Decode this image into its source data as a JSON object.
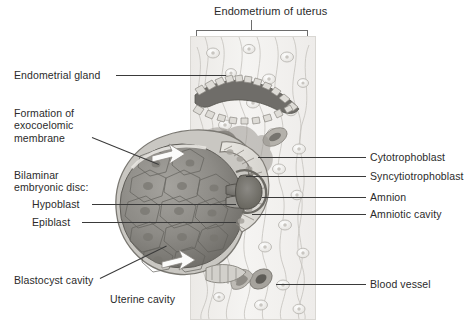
{
  "figure": {
    "title": "Endometrium of uterus",
    "background_color": "#ffffff",
    "label_color": "#2b2b2b",
    "leader_color": "#3a3a3a"
  },
  "labels_left": [
    {
      "id": "endometrial-gland",
      "text": "Endometrial gland"
    },
    {
      "id": "exocoelomic-membrane",
      "line1": "Formation of",
      "line2": "exocoelomic",
      "line3": "membrane"
    },
    {
      "id": "bilaminar-disc",
      "line1": "Bilaminar",
      "line2": "embryonic disc:"
    },
    {
      "id": "hypoblast",
      "text": "Hypoblast"
    },
    {
      "id": "epiblast",
      "text": "Epiblast"
    },
    {
      "id": "blastocyst-cavity",
      "text": "Blastocyst cavity"
    },
    {
      "id": "uterine-cavity",
      "text": "Uterine cavity"
    }
  ],
  "labels_right": [
    {
      "id": "cytotrophoblast",
      "text": "Cytotrophoblast"
    },
    {
      "id": "syncytiotrophoblast",
      "text": "Syncytiotrophoblast"
    },
    {
      "id": "amnion",
      "text": "Amnion"
    },
    {
      "id": "amniotic-cavity",
      "text": "Amniotic cavity"
    },
    {
      "id": "blood-vessel",
      "text": "Blood vessel"
    }
  ],
  "palette": {
    "stroma_light": "#f3f2f0",
    "stroma_line": "#b9b6b1",
    "epithelium_fill": "#d8d6d1",
    "epithelium_stroke": "#8f8c86",
    "gland_lumen": "#6f6d69",
    "cyto_fill": "#e6e4df",
    "syncytio_fill": "#9b9891",
    "disc_dark": "#7b7974",
    "disc_mid": "#96948e",
    "blastocyst_fill": "#878581",
    "vessel_fill": "#7e7c77",
    "arrow_fill": "#fbfbfa"
  }
}
